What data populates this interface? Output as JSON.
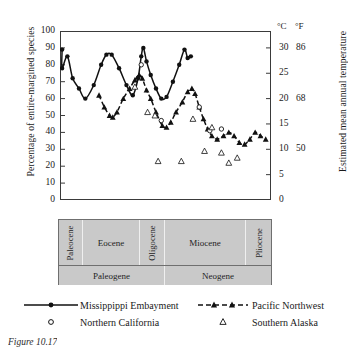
{
  "figure": {
    "caption": "Figure 10.17"
  },
  "axes": {
    "left": {
      "title": "Percentage of entire-margined species",
      "ticks": [
        100,
        90,
        80,
        70,
        60,
        50,
        40,
        30,
        20,
        10,
        0
      ],
      "min": 0,
      "max": 100
    },
    "right": {
      "title": "Estimated mean annual temperature",
      "unit_celsius": "°C",
      "unit_fahrenheit": "°F",
      "celsius_ticks": [
        30,
        25,
        20,
        15,
        10,
        5,
        0
      ],
      "fahrenheit_ticks": [
        {
          "c": 30,
          "f": 86
        },
        {
          "c": 20,
          "f": 68
        },
        {
          "c": 10,
          "f": 50
        }
      ]
    }
  },
  "timescale": {
    "epochs": [
      {
        "label": "Paleocene",
        "width": 11.2,
        "vertical": true
      },
      {
        "label": "Eocene",
        "width": 27.1,
        "vertical": false
      },
      {
        "label": "Oligocene",
        "width": 11.7,
        "vertical": true
      },
      {
        "label": "Miocene",
        "width": 38.3,
        "vertical": false
      },
      {
        "label": "Pliocene",
        "width": 11.7,
        "vertical": true
      }
    ],
    "periods": [
      {
        "label": "Paleogene",
        "width": 50.0
      },
      {
        "label": "Neogene",
        "width": 50.0
      }
    ]
  },
  "legend": {
    "items": [
      {
        "label": "Missippippi Embayment",
        "symbol": "solid-line-filled-circle"
      },
      {
        "label": "Pacific Northwest",
        "symbol": "dashed-line-filled-triangle"
      },
      {
        "label": "Northern California",
        "symbol": "open-circle"
      },
      {
        "label": "Southern Alaska",
        "symbol": "open-triangle"
      }
    ]
  },
  "colors": {
    "line": "#111111",
    "frame": "#3a3a3a",
    "timescale_fill": "#c9c9c9",
    "timescale_border": "#6f6f6f",
    "text": "#1a1a1a"
  },
  "chart_data": {
    "type": "line",
    "xlabel": "",
    "ylabel": "Percentage of entire-margined species",
    "y2label": "Estimated mean annual temperature",
    "ylim": [
      0,
      100
    ],
    "y2lim_celsius": [
      0,
      30
    ],
    "xlim": [
      0,
      100
    ],
    "grid": false,
    "legend_position": "below-plot",
    "axis_note": "x axis is geological time, left (old) to right (young); no numeric tick labels shown",
    "series": [
      {
        "name": "Missippippi Embayment",
        "style": "solid line with filled circles",
        "marker": "filled-circle",
        "points": [
          {
            "x": 1.0,
            "y": 89
          },
          {
            "x": 1.0,
            "y": 78
          },
          {
            "x": 3.5,
            "y": 85
          },
          {
            "x": 6.0,
            "y": 72
          },
          {
            "x": 9.0,
            "y": 66
          },
          {
            "x": 12.0,
            "y": 60
          },
          {
            "x": 16.0,
            "y": 68
          },
          {
            "x": 19.5,
            "y": 80
          },
          {
            "x": 22.0,
            "y": 86
          },
          {
            "x": 24.5,
            "y": 86
          },
          {
            "x": 28.0,
            "y": 78
          },
          {
            "x": 31.5,
            "y": 68
          },
          {
            "x": 34.5,
            "y": 62
          },
          {
            "x": 37.0,
            "y": 72
          },
          {
            "x": 38.5,
            "y": 85
          },
          {
            "x": 39.5,
            "y": 90
          },
          {
            "x": 41.0,
            "y": 82
          },
          {
            "x": 43.0,
            "y": 74
          },
          {
            "x": 45.5,
            "y": 66
          },
          {
            "x": 48.0,
            "y": 60
          },
          {
            "x": 50.5,
            "y": 61
          },
          {
            "x": 53.5,
            "y": 70
          },
          {
            "x": 56.5,
            "y": 80
          },
          {
            "x": 59.0,
            "y": 89
          },
          {
            "x": 60.5,
            "y": 84
          },
          {
            "x": 62.0,
            "y": 85
          }
        ]
      },
      {
        "name": "Pacific Northwest",
        "style": "dashed line with filled triangles",
        "marker": "filled-triangle",
        "points": [
          {
            "x": 18.5,
            "y": 62
          },
          {
            "x": 21.0,
            "y": 55
          },
          {
            "x": 23.5,
            "y": 50
          },
          {
            "x": 25.0,
            "y": 49
          },
          {
            "x": 27.0,
            "y": 52
          },
          {
            "x": 30.0,
            "y": 60
          },
          {
            "x": 33.0,
            "y": 66
          },
          {
            "x": 35.5,
            "y": 71
          },
          {
            "x": 37.5,
            "y": 74
          },
          {
            "x": 39.0,
            "y": 72
          },
          {
            "x": 41.0,
            "y": 65
          },
          {
            "x": 43.0,
            "y": 60
          },
          {
            "x": 45.5,
            "y": 52
          },
          {
            "x": 48.5,
            "y": 44
          },
          {
            "x": 50.5,
            "y": 43
          },
          {
            "x": 52.5,
            "y": 46
          },
          {
            "x": 55.0,
            "y": 52
          },
          {
            "x": 58.0,
            "y": 58
          },
          {
            "x": 60.5,
            "y": 64
          },
          {
            "x": 62.5,
            "y": 66
          },
          {
            "x": 64.0,
            "y": 63
          },
          {
            "x": 66.0,
            "y": 55
          },
          {
            "x": 68.0,
            "y": 48
          },
          {
            "x": 70.0,
            "y": 42
          },
          {
            "x": 72.0,
            "y": 38
          },
          {
            "x": 74.5,
            "y": 36
          },
          {
            "x": 77.5,
            "y": 38
          },
          {
            "x": 80.0,
            "y": 40
          },
          {
            "x": 82.5,
            "y": 38
          },
          {
            "x": 85.0,
            "y": 34
          },
          {
            "x": 87.5,
            "y": 33
          },
          {
            "x": 90.0,
            "y": 36
          },
          {
            "x": 92.5,
            "y": 40
          },
          {
            "x": 95.0,
            "y": 38
          },
          {
            "x": 97.5,
            "y": 36
          }
        ]
      },
      {
        "name": "Northern California",
        "style": "open circles only",
        "marker": "open-circle",
        "points": [
          {
            "x": 38.5,
            "y": 80
          },
          {
            "x": 48.0,
            "y": 47
          },
          {
            "x": 66.0,
            "y": 55
          },
          {
            "x": 71.0,
            "y": 41
          },
          {
            "x": 76.5,
            "y": 42
          }
        ]
      },
      {
        "name": "Southern Alaska",
        "style": "open triangles only",
        "marker": "open-triangle",
        "points": [
          {
            "x": 35.5,
            "y": 67
          },
          {
            "x": 41.5,
            "y": 52
          },
          {
            "x": 45.0,
            "y": 50
          },
          {
            "x": 46.5,
            "y": 23
          },
          {
            "x": 57.5,
            "y": 23
          },
          {
            "x": 63.0,
            "y": 48
          },
          {
            "x": 68.5,
            "y": 29
          },
          {
            "x": 72.0,
            "y": 43
          },
          {
            "x": 76.5,
            "y": 28
          },
          {
            "x": 80.0,
            "y": 22
          },
          {
            "x": 84.0,
            "y": 25
          }
        ]
      }
    ]
  }
}
